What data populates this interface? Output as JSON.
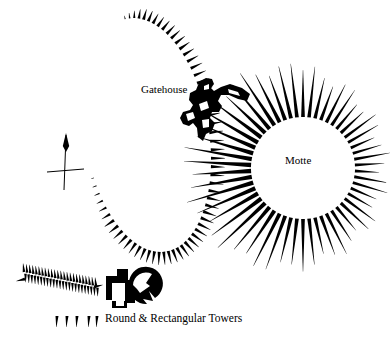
{
  "figure": {
    "type": "archaeological-site-plan",
    "background_color": "#ffffff",
    "ink_color": "#000000"
  },
  "labels": {
    "gatehouse": "Gatehouse",
    "motte": "Motte",
    "towers_caption": "Round & Rectangular Towers"
  },
  "icons": {
    "north_arrow": "north-arrow-icon",
    "hachure_key": "hachure-key-icon"
  },
  "features": [
    {
      "id": "bailey-rampart",
      "name": "Bailey rampart",
      "rendering": "hachured-curve",
      "hachure_count": 62,
      "description": "Large ovoid bailey enclosure drawn with short tapering hachures pointing outward"
    },
    {
      "id": "motte",
      "name": "Motte",
      "rendering": "hachured-mound",
      "hachure_count": 54,
      "description": "Circular mound with long radiating hachures, thick at the summit edge tapering outward"
    },
    {
      "id": "gatehouse",
      "name": "Gatehouse",
      "rendering": "solid-masonry-plan",
      "description": "Solid black masonry plan of gatehouse between bailey and motte"
    },
    {
      "id": "towers",
      "name": "Round & Rectangular Towers",
      "rendering": "solid-masonry-plan",
      "description": "Solid black masonry plan showing a rectangular tower adjoining a round tower"
    },
    {
      "id": "outwork-bank",
      "name": "Outwork bank",
      "rendering": "double-hachured-bank",
      "description": "Linear bank at lower left with hachures on both sides"
    },
    {
      "id": "north-arrow",
      "name": "North arrow",
      "rendering": "arrow-and-cross",
      "description": "Vertical north arrow crossing a horizontal tick mark"
    },
    {
      "id": "hachure-key",
      "name": "Hachure key",
      "rendering": "five-hachure-marks",
      "count": 5,
      "description": "Row of five hachure marks serving as a legend key beneath the outwork"
    }
  ]
}
